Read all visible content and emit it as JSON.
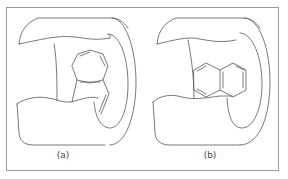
{
  "figure": {
    "panels": [
      {
        "id": "a",
        "label": "(a)",
        "description": "Molecule inside hollow cylinder, ring with side chain bent"
      },
      {
        "id": "b",
        "label": "(b)",
        "description": "Naphthalene-like fused rings inside hollow cylinder"
      }
    ],
    "colors": {
      "line": "#555555",
      "frame": "#9a9a9a",
      "background": "#ffffff"
    }
  }
}
